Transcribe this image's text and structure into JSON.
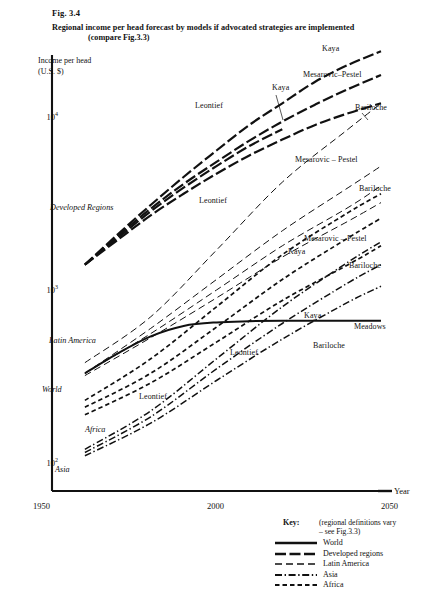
{
  "figure": {
    "number": "Fig. 3.4",
    "title": "Regional income per head forecast by models if advocated strategies are implemented",
    "subtitle": "(compare Fig.3.3)"
  },
  "axes": {
    "y_label_line1": "Income per head",
    "y_label_line2": "(U.S. $)",
    "y_ticks": [
      "10",
      "10",
      "10"
    ],
    "y_tick_exponents": [
      "4",
      "3",
      "2"
    ],
    "x_ticks": [
      "1950",
      "2000",
      "2050"
    ],
    "x_axis_name": "Year"
  },
  "region_labels": [
    {
      "name": "Developed Regions"
    },
    {
      "name": "Latin America"
    },
    {
      "name": "World"
    },
    {
      "name": "Africa"
    },
    {
      "name": "Asia"
    }
  ],
  "curve_labels": [
    {
      "name": "Kaya"
    },
    {
      "name": "Mesarovic–Pestel"
    },
    {
      "name": "Bariloche"
    },
    {
      "name": "Leontief"
    },
    {
      "name": "Kaya"
    },
    {
      "name": "Mesarovic – Pestel"
    },
    {
      "name": "Bariloche"
    },
    {
      "name": "Leontief"
    },
    {
      "name": "Mesarovic – Pestel"
    },
    {
      "name": "Kaya"
    },
    {
      "name": "Bariloche"
    },
    {
      "name": "Kaya"
    },
    {
      "name": "Meadows"
    },
    {
      "name": "Leontief"
    },
    {
      "name": "Bariloche"
    },
    {
      "name": "Leontief"
    }
  ],
  "key": {
    "title": "Key:",
    "note_line1": "(regional definitions vary",
    "note_line2": "– see Fig.3.3)",
    "items": [
      {
        "label": "World",
        "style": "solid"
      },
      {
        "label": "Developed regions",
        "style": "long-dash"
      },
      {
        "label": "Latin America",
        "style": "medium-dash"
      },
      {
        "label": "Asia",
        "style": "dash-dot"
      },
      {
        "label": "Africa",
        "style": "short-dash"
      }
    ]
  },
  "chart_data": {
    "type": "line",
    "title": "Regional income per head forecast by models if advocated strategies are implemented",
    "xlabel": "Year",
    "ylabel": "Income per head (U.S. $)",
    "yscale": "log",
    "xlim": [
      1950,
      2050
    ],
    "ylim": [
      100,
      20000
    ],
    "grid": false,
    "legend_position": "bottom-right",
    "series": [
      {
        "name": "Developed Regions – Kaya",
        "region": "Developed Regions",
        "model": "Kaya",
        "style": "long-dash",
        "x": [
          1960,
          1970,
          1980,
          1990,
          2000,
          2010,
          2020,
          2030,
          2040,
          2050
        ],
        "y": [
          1400,
          2100,
          3100,
          4500,
          6400,
          9000,
          12000,
          16000,
          20000,
          24000
        ]
      },
      {
        "name": "Developed Regions – Mesarovic–Pestel",
        "region": "Developed Regions",
        "model": "Mesarovic–Pestel",
        "style": "long-dash",
        "x": [
          1960,
          1970,
          1980,
          1990,
          2000,
          2010,
          2020,
          2030,
          2040,
          2050
        ],
        "y": [
          1400,
          2050,
          2950,
          4100,
          5500,
          7300,
          9400,
          11800,
          14500,
          17500
        ]
      },
      {
        "name": "Developed Regions – Leontief",
        "region": "Developed Regions",
        "model": "Leontief",
        "style": "long-dash",
        "x": [
          1960,
          1970,
          1980,
          1990,
          2000,
          2010,
          2020
        ],
        "y": [
          1400,
          2000,
          2850,
          3900,
          5200,
          6800,
          8500
        ]
      },
      {
        "name": "Developed Regions – Bariloche",
        "region": "Developed Regions",
        "model": "Bariloche",
        "style": "long-dash",
        "x": [
          1960,
          1970,
          1980,
          1990,
          2000,
          2010,
          2020,
          2030,
          2040,
          2050
        ],
        "y": [
          1400,
          1950,
          2700,
          3600,
          4700,
          6000,
          7400,
          9000,
          10500,
          12000
        ]
      },
      {
        "name": "Latin America – Kaya",
        "region": "Latin America",
        "model": "Kaya",
        "style": "medium-dash",
        "x": [
          1960,
          1980,
          2000,
          2020,
          2040,
          2050
        ],
        "y": [
          380,
          700,
          1700,
          4200,
          8500,
          12000
        ]
      },
      {
        "name": "Latin America – Mesarovic–Pestel",
        "region": "Latin America",
        "model": "Mesarovic – Pestel",
        "style": "medium-dash",
        "x": [
          1960,
          1980,
          2000,
          2020,
          2040,
          2050
        ],
        "y": [
          330,
          600,
          1150,
          2200,
          3900,
          5200
        ]
      },
      {
        "name": "Latin America – Bariloche",
        "region": "Latin America",
        "model": "Bariloche",
        "style": "medium-dash",
        "x": [
          1960,
          1980,
          2000,
          2020,
          2040,
          2050
        ],
        "y": [
          330,
          560,
          1000,
          1800,
          3000,
          4000
        ]
      },
      {
        "name": "Latin America – Leontief",
        "region": "Latin America",
        "model": "Leontief",
        "style": "medium-dash",
        "x": [
          1960,
          1980,
          2000,
          2020,
          2040,
          2050
        ],
        "y": [
          320,
          530,
          900,
          1550,
          2500,
          3200
        ]
      },
      {
        "name": "World",
        "region": "World",
        "model": "Meadows",
        "style": "solid",
        "x": [
          1960,
          1970,
          1980,
          1990,
          2000,
          2010,
          2020,
          2030,
          2040,
          2050
        ],
        "y": [
          330,
          430,
          540,
          620,
          650,
          660,
          665,
          665,
          665,
          665
        ]
      },
      {
        "name": "Africa – Mesarovic–Pestel",
        "region": "Africa",
        "model": "Mesarovic – Pestel",
        "style": "short-dash",
        "x": [
          1960,
          1980,
          2000,
          2020,
          2040,
          2050
        ],
        "y": [
          230,
          400,
          800,
          1600,
          2800,
          3600
        ]
      },
      {
        "name": "Africa – Kaya",
        "region": "Africa",
        "model": "Kaya",
        "style": "short-dash",
        "x": [
          1960,
          1980,
          2000,
          2020,
          2040,
          2050
        ],
        "y": [
          210,
          330,
          610,
          1150,
          2000,
          2600
        ]
      },
      {
        "name": "Africa – Bariloche",
        "region": "Africa",
        "model": "Bariloche",
        "style": "short-dash",
        "x": [
          1960,
          1980,
          2000,
          2020,
          2040,
          2050
        ],
        "y": [
          190,
          290,
          500,
          870,
          1400,
          1800
        ]
      },
      {
        "name": "Asia – Kaya",
        "region": "Asia",
        "model": "Kaya",
        "style": "dash-dot",
        "x": [
          1960,
          1980,
          2000,
          2020,
          2040,
          2050
        ],
        "y": [
          120,
          200,
          400,
          800,
          1450,
          1900
        ]
      },
      {
        "name": "Asia – Leontief",
        "region": "Asia",
        "model": "Leontief",
        "style": "dash-dot",
        "x": [
          1960,
          1980,
          2000,
          2020,
          2040,
          2050
        ],
        "y": [
          115,
          185,
          350,
          640,
          1100,
          1400
        ]
      },
      {
        "name": "Asia – Bariloche",
        "region": "Asia",
        "model": "Bariloche",
        "style": "dash-dot",
        "x": [
          1960,
          1980,
          2000,
          2020,
          2040,
          2050
        ],
        "y": [
          110,
          170,
          300,
          520,
          850,
          1050
        ]
      }
    ]
  }
}
